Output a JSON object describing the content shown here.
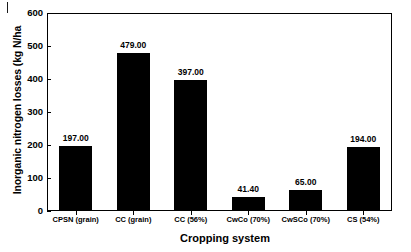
{
  "chart_data": {
    "type": "bar",
    "title": "",
    "xlabel": "Cropping system",
    "ylabel": "Inorganic nitrogen losses (kg N/ha",
    "categories": [
      "CPSN (grain)",
      "CC (grain)",
      "CC (56%)",
      "CwCo (70%)",
      "CwSCo (70%)",
      "CS (54%)"
    ],
    "values": [
      197.0,
      479.0,
      397.0,
      41.4,
      65.0,
      194.0
    ],
    "value_labels": [
      "197.00",
      "479.00",
      "397.00",
      "41.40",
      "65.00",
      "194.00"
    ],
    "ylim": [
      0,
      600
    ],
    "yticks": [
      600,
      500,
      400,
      300,
      200,
      100,
      0
    ],
    "ytick_labels": [
      "600",
      "500",
      "400",
      "300",
      "200",
      "100",
      "0"
    ],
    "grid": false,
    "legend": "none",
    "bar_color": "#000000",
    "background_color": "#ffffff",
    "axis_color": "#000000"
  }
}
